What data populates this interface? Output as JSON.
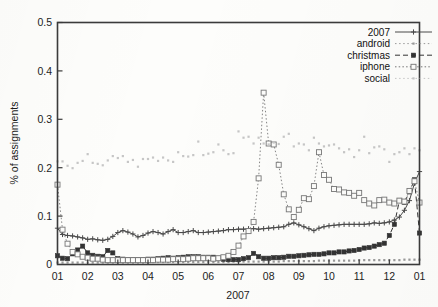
{
  "chart_data": {
    "type": "line",
    "title": "",
    "xlabel": "2007",
    "ylabel": "% of assignments",
    "ylim": [
      0,
      0.5
    ],
    "ytick_labels": [
      "0",
      "0.1",
      "0.2",
      "0.3",
      "0.4",
      "0.5"
    ],
    "ytick_values": [
      0,
      0.1,
      0.2,
      0.3,
      0.4,
      0.5
    ],
    "xtick_labels": [
      "01",
      "02",
      "03",
      "04",
      "05",
      "06",
      "07",
      "08",
      "09",
      "10",
      "11",
      "12",
      "01"
    ],
    "xtick_values": [
      0,
      1,
      2,
      3,
      4,
      5,
      6,
      7,
      8,
      9,
      10,
      11,
      12
    ],
    "xlim": [
      0,
      12
    ],
    "grid": false,
    "legend_position": "top-right",
    "x": [
      0,
      0.1667,
      0.3333,
      0.5,
      0.6667,
      0.8333,
      1,
      1.1667,
      1.3333,
      1.5,
      1.6667,
      1.8333,
      2,
      2.1667,
      2.3333,
      2.5,
      2.6667,
      2.8333,
      3,
      3.1667,
      3.3333,
      3.5,
      3.6667,
      3.8333,
      4,
      4.1667,
      4.3333,
      4.5,
      4.6667,
      4.8333,
      5,
      5.1667,
      5.3333,
      5.5,
      5.6667,
      5.8333,
      6,
      6.1667,
      6.3333,
      6.5,
      6.6667,
      6.8333,
      7,
      7.1667,
      7.3333,
      7.5,
      7.6667,
      7.8333,
      8,
      8.1667,
      8.3333,
      8.5,
      8.6667,
      8.8333,
      9,
      9.1667,
      9.3333,
      9.5,
      9.6667,
      9.8333,
      10,
      10.1667,
      10.3333,
      10.5,
      10.6667,
      10.8333,
      11,
      11.1667,
      11.3333,
      11.5,
      11.6667,
      11.8333,
      12
    ],
    "series": [
      {
        "name": "2007",
        "marker": "plus",
        "color": "#4a4a4a",
        "dash": "none",
        "values": [
          0.075,
          0.062,
          0.06,
          0.059,
          0.057,
          0.055,
          0.052,
          0.053,
          0.051,
          0.05,
          0.052,
          0.058,
          0.066,
          0.07,
          0.067,
          0.063,
          0.057,
          0.06,
          0.065,
          0.068,
          0.066,
          0.063,
          0.068,
          0.072,
          0.066,
          0.066,
          0.068,
          0.07,
          0.066,
          0.066,
          0.067,
          0.068,
          0.069,
          0.07,
          0.072,
          0.072,
          0.073,
          0.073,
          0.074,
          0.074,
          0.073,
          0.074,
          0.075,
          0.076,
          0.077,
          0.078,
          0.083,
          0.086,
          0.082,
          0.078,
          0.074,
          0.07,
          0.075,
          0.078,
          0.08,
          0.081,
          0.082,
          0.083,
          0.083,
          0.083,
          0.083,
          0.083,
          0.084,
          0.086,
          0.085,
          0.086,
          0.088,
          0.092,
          0.098,
          0.112,
          0.132,
          0.168,
          0.192
        ]
      },
      {
        "name": "android",
        "marker": "dot",
        "color": "#9a9a9a",
        "dash": "none",
        "values": [
          0.004,
          0.004,
          0.004,
          0.004,
          0.004,
          0.004,
          0.004,
          0.004,
          0.004,
          0.004,
          0.004,
          0.004,
          0.004,
          0.004,
          0.004,
          0.004,
          0.004,
          0.004,
          0.004,
          0.005,
          0.005,
          0.005,
          0.005,
          0.005,
          0.005,
          0.005,
          0.005,
          0.005,
          0.005,
          0.005,
          0.005,
          0.005,
          0.005,
          0.005,
          0.005,
          0.006,
          0.006,
          0.006,
          0.006,
          0.006,
          0.006,
          0.006,
          0.006,
          0.006,
          0.006,
          0.007,
          0.007,
          0.007,
          0.007,
          0.007,
          0.007,
          0.007,
          0.008,
          0.008,
          0.008,
          0.008,
          0.008,
          0.008,
          0.008,
          0.008,
          0.009,
          0.009,
          0.009,
          0.009,
          0.009,
          0.009,
          0.009,
          0.009,
          0.009,
          0.01,
          0.01,
          0.01,
          0.01
        ]
      },
      {
        "name": "christmas",
        "marker": "filled-square",
        "color": "#333333",
        "dash": "dashed",
        "values": [
          0.018,
          0.013,
          0.012,
          0.022,
          0.03,
          0.038,
          0.024,
          0.019,
          0.017,
          0.016,
          0.029,
          0.024,
          0.012,
          0.011,
          0.01,
          0.01,
          0.01,
          0.01,
          0.011,
          0.011,
          0.012,
          0.013,
          0.014,
          0.013,
          0.014,
          0.015,
          0.016,
          0.016,
          0.016,
          0.015,
          0.015,
          0.015,
          0.013,
          0.011,
          0.01,
          0.01,
          0.01,
          0.012,
          0.014,
          0.023,
          0.016,
          0.013,
          0.013,
          0.014,
          0.014,
          0.015,
          0.017,
          0.017,
          0.018,
          0.019,
          0.02,
          0.021,
          0.021,
          0.022,
          0.024,
          0.024,
          0.026,
          0.026,
          0.028,
          0.029,
          0.031,
          0.034,
          0.035,
          0.038,
          0.041,
          0.044,
          0.06,
          0.083,
          0.132,
          0.128,
          0.15,
          0.175,
          0.065
        ]
      },
      {
        "name": "iphone",
        "marker": "open-square",
        "color": "#777777",
        "dash": "dotted",
        "values": [
          0.165,
          0.072,
          0.043,
          0.026,
          0.021,
          0.016,
          0.014,
          0.012,
          0.012,
          0.01,
          0.009,
          0.009,
          0.009,
          0.009,
          0.009,
          0.009,
          0.009,
          0.009,
          0.009,
          0.009,
          0.01,
          0.01,
          0.01,
          0.011,
          0.011,
          0.011,
          0.012,
          0.013,
          0.013,
          0.013,
          0.013,
          0.012,
          0.013,
          0.015,
          0.018,
          0.026,
          0.039,
          0.058,
          0.069,
          0.088,
          0.178,
          0.355,
          0.25,
          0.248,
          0.206,
          0.145,
          0.114,
          0.098,
          0.113,
          0.137,
          0.135,
          0.162,
          0.232,
          0.185,
          0.175,
          0.156,
          0.155,
          0.149,
          0.148,
          0.142,
          0.148,
          0.133,
          0.126,
          0.122,
          0.133,
          0.134,
          0.128,
          0.126,
          0.132,
          0.13,
          0.152,
          0.172,
          0.128
        ]
      },
      {
        "name": "social",
        "marker": "dot",
        "color": "#c6c6c6",
        "dash": "dotted",
        "values": [
          0.213,
          0.213,
          0.204,
          0.199,
          0.21,
          0.214,
          0.228,
          0.21,
          0.208,
          0.205,
          0.215,
          0.224,
          0.22,
          0.224,
          0.212,
          0.216,
          0.202,
          0.218,
          0.218,
          0.221,
          0.214,
          0.221,
          0.215,
          0.212,
          0.232,
          0.224,
          0.223,
          0.226,
          0.254,
          0.226,
          0.229,
          0.232,
          0.248,
          0.236,
          0.228,
          0.23,
          0.275,
          0.262,
          0.264,
          0.25,
          0.262,
          0.25,
          0.248,
          0.252,
          0.249,
          0.264,
          0.27,
          0.244,
          0.25,
          0.248,
          0.236,
          0.262,
          0.25,
          0.244,
          0.246,
          0.248,
          0.24,
          0.232,
          0.238,
          0.222,
          0.236,
          0.264,
          0.23,
          0.242,
          0.244,
          0.238,
          0.212,
          0.228,
          0.232,
          0.24,
          0.228,
          0.24,
          0.236
        ]
      }
    ]
  }
}
